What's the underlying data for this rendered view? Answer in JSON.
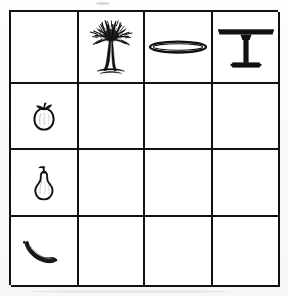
{
  "worksheet": {
    "type": "picture-matrix-grid",
    "rows": 4,
    "columns": 4,
    "border_color": "#111111",
    "background_color": "#ffffff",
    "ink_color": "#111111"
  },
  "grid": {
    "corner_cell": {
      "icon": "empty-cell",
      "label": ""
    },
    "column_headers": [
      {
        "icon": "tree-icon",
        "label": "tree"
      },
      {
        "icon": "plate-icon",
        "label": "plate"
      },
      {
        "icon": "table-icon",
        "label": "table"
      }
    ],
    "row_headers": [
      {
        "icon": "apple-icon",
        "label": "apple"
      },
      {
        "icon": "pear-icon",
        "label": "pear"
      },
      {
        "icon": "banana-icon",
        "label": "banana"
      }
    ],
    "body_cells": [
      [
        {
          "icon": "empty-cell",
          "label": ""
        },
        {
          "icon": "empty-cell",
          "label": ""
        },
        {
          "icon": "empty-cell",
          "label": ""
        }
      ],
      [
        {
          "icon": "empty-cell",
          "label": ""
        },
        {
          "icon": "empty-cell",
          "label": ""
        },
        {
          "icon": "empty-cell",
          "label": ""
        }
      ],
      [
        {
          "icon": "empty-cell",
          "label": ""
        },
        {
          "icon": "empty-cell",
          "label": ""
        },
        {
          "icon": "empty-cell",
          "label": ""
        }
      ]
    ]
  }
}
